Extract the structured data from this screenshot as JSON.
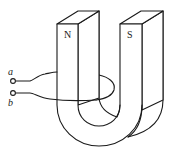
{
  "figure": {
    "title": ""
  },
  "magnet": {
    "north_label": "N",
    "south_label": "S"
  },
  "terminals": {
    "a_label": "a",
    "b_label": "b"
  },
  "colors": {
    "stroke": "#1a1a1a",
    "background": "#ffffff"
  }
}
